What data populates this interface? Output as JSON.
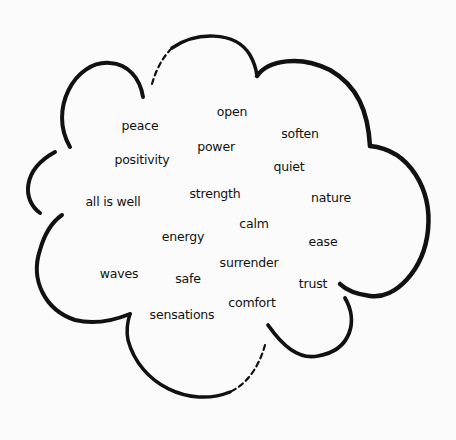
{
  "diagram": {
    "type": "word-cloud-in-thought-bubble",
    "colors": {
      "background": "#fbfbfb",
      "outline": "#111111",
      "text": "#111111"
    },
    "words": [
      {
        "text": "open",
        "x": 232,
        "y": 111
      },
      {
        "text": "peace",
        "x": 140,
        "y": 125
      },
      {
        "text": "power",
        "x": 216,
        "y": 146
      },
      {
        "text": "soften",
        "x": 300,
        "y": 133
      },
      {
        "text": "positivity",
        "x": 142,
        "y": 159
      },
      {
        "text": "quiet",
        "x": 289,
        "y": 166
      },
      {
        "text": "strength",
        "x": 215,
        "y": 193
      },
      {
        "text": "all is well",
        "x": 113,
        "y": 201
      },
      {
        "text": "nature",
        "x": 331,
        "y": 197
      },
      {
        "text": "calm",
        "x": 254,
        "y": 223
      },
      {
        "text": "energy",
        "x": 183,
        "y": 236
      },
      {
        "text": "ease",
        "x": 323,
        "y": 241
      },
      {
        "text": "surrender",
        "x": 249,
        "y": 262
      },
      {
        "text": "waves",
        "x": 119,
        "y": 273
      },
      {
        "text": "safe",
        "x": 188,
        "y": 278
      },
      {
        "text": "trust",
        "x": 313,
        "y": 283
      },
      {
        "text": "comfort",
        "x": 252,
        "y": 302
      },
      {
        "text": "sensations",
        "x": 182,
        "y": 314
      }
    ]
  }
}
